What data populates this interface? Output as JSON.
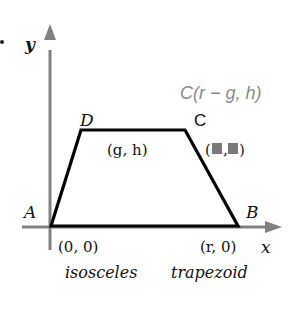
{
  "diagram": {
    "type": "coordinate-geometry",
    "caption": [
      "isosceles",
      "trapezoid"
    ],
    "axes": {
      "x_label": "x",
      "y_label": "y"
    },
    "vertices": {
      "A": {
        "label": "A",
        "coord": "(0, 0)"
      },
      "B": {
        "label": "B",
        "coord": "(r, 0)"
      },
      "C": {
        "label": "C",
        "coord": "(■,■)"
      },
      "D": {
        "label": "D",
        "coord": "(g, h)"
      }
    },
    "annotation": "C(r − g, h)",
    "colors": {
      "axis": "#808080",
      "shape": "#000000",
      "annotation": "#8a8a8a",
      "placeholder": "#7a7a7a"
    }
  }
}
